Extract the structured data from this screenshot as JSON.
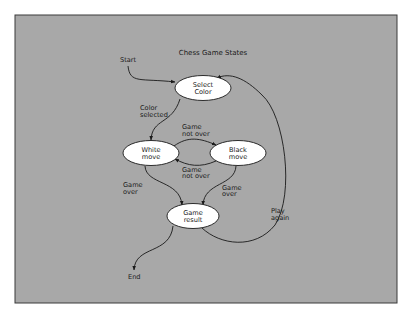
{
  "diagram": {
    "title": "Chess Game States",
    "colors": {
      "panel_fill": "#a8a8a8",
      "panel_border": "#3a3a3a",
      "node_fill": "#ffffff",
      "edge": "#1a1a1a"
    },
    "terminals": {
      "start": "Start",
      "end": "End"
    },
    "nodes": [
      {
        "id": "select_color",
        "line1": "Select",
        "line2": "Color"
      },
      {
        "id": "white_move",
        "line1": "White",
        "line2": "move"
      },
      {
        "id": "black_move",
        "line1": "Black",
        "line2": "move"
      },
      {
        "id": "game_result",
        "line1": "Game",
        "line2": "result"
      }
    ],
    "edges": [
      {
        "from": "start",
        "to": "select_color",
        "line1": "",
        "line2": ""
      },
      {
        "from": "select_color",
        "to": "white_move",
        "line1": "Color",
        "line2": "selected"
      },
      {
        "from": "white_move",
        "to": "black_move",
        "line1": "Game",
        "line2": "not over"
      },
      {
        "from": "black_move",
        "to": "white_move",
        "line1": "Game",
        "line2": "not over"
      },
      {
        "from": "white_move",
        "to": "game_result",
        "line1": "Game",
        "line2": "over"
      },
      {
        "from": "black_move",
        "to": "game_result",
        "line1": "Game",
        "line2": "over"
      },
      {
        "from": "game_result",
        "to": "select_color",
        "line1": "Play",
        "line2": "again"
      },
      {
        "from": "game_result",
        "to": "end",
        "line1": "",
        "line2": ""
      }
    ]
  }
}
